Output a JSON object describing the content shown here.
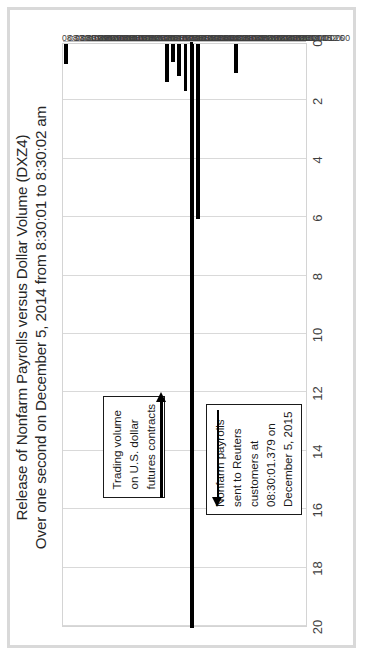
{
  "chart_data": {
    "type": "bar",
    "orientation": "horizontal-rotated",
    "title": "Release of Nonfarm Payrolls versus Dollar Volume (DXZ4)",
    "subtitle": "Over one second on December 5, 2014 from 8:30:01 to 8:30:02 am",
    "xlabel": "",
    "ylabel": "",
    "value_axis_ticks": [
      20,
      18,
      16,
      14,
      12,
      10,
      8,
      6,
      4,
      2,
      0
    ],
    "value_axis_range": [
      0,
      20
    ],
    "value_axis_reversed": true,
    "grid": true,
    "legend": "none",
    "categories": [
      "08:30:01.000",
      "08:30:01.026",
      "08:30:01.052",
      "08:30:01.078",
      "08:30:01.104",
      "08:30:01.130",
      "08:30:01.156",
      "08:30:01.182",
      "08:30:01.208",
      "08:30:01.234",
      "08:30:01.260",
      "08:30:01.286",
      "08:30:01.312",
      "08:30:01.338",
      "08:30:01.364",
      "08:30:01.390",
      "08:30:01.416",
      "08:30:01.442",
      "08:30:01.468",
      "08:30:01.494",
      "08:30:01.520",
      "08:30:01.546",
      "08:30:01.572",
      "08:30:01.598",
      "08:30:01.624",
      "08:30:01.650",
      "08:30:01.676",
      "08:30:01.702",
      "08:30:01.728",
      "08:30:01.754",
      "08:30:01.780",
      "08:30:01.806",
      "08:30:01.832",
      "08:30:01.858",
      "08:30:01.884",
      "08:30:01.910",
      "08:30:01.936",
      "08:30:01.962",
      "08:30:01.988"
    ],
    "values": [
      0,
      0,
      0,
      0,
      0,
      0,
      0,
      0,
      0,
      0,
      0,
      1.0,
      0,
      0,
      0,
      0,
      0,
      6.0,
      20.0,
      1.6,
      1.1,
      0.6,
      1.3,
      0,
      0,
      0,
      0,
      0,
      0,
      0,
      0,
      0,
      0,
      0,
      0,
      0,
      0,
      0,
      0.7
    ],
    "series_name": "Dollar volume (contracts)",
    "annotations": [
      {
        "name": "nonfarm-payrolls-callout",
        "lines": [
          "Nonfarm payrolls",
          "sent to Reuters",
          "customers at",
          "08:30:01.379 on",
          "December 5, 2015"
        ],
        "points_to": "08:30:01.442"
      },
      {
        "name": "trading-volume-callout",
        "lines": [
          "Trading volume",
          "on U.S. dollar",
          "futures contracts"
        ],
        "points_to": "08:30:01.468"
      }
    ],
    "colors": {
      "bar": "#000000",
      "gridline": "#d9d9d9",
      "plot_border": "#d4d4d4",
      "frame": "#d9d9d9",
      "text": "#262626",
      "callout_border": "#1a1a1a"
    }
  }
}
